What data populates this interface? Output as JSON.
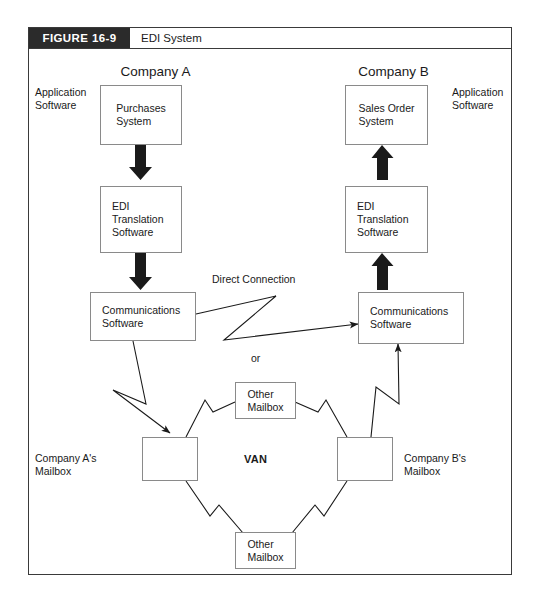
{
  "figure": {
    "tag": "FIGURE 16-9",
    "caption": "EDI System"
  },
  "colors": {
    "tag_background": "#2b2b2b",
    "tag_text": "#ffffff",
    "frame_border": "#3a3a3a",
    "box_border": "#8a8a8a",
    "line": "#1a1a1a",
    "page_background": "#ffffff"
  },
  "diagram": {
    "company_a_title": "Company A",
    "company_b_title": "Company B",
    "app_software_left": "Application\nSoftware",
    "app_software_right": "Application\nSoftware",
    "direct_connection": "Direct Connection",
    "or": "or",
    "van": "VAN",
    "mailbox_a_label": "Company A's\nMailbox",
    "mailbox_b_label": "Company B's\nMailbox",
    "nodes": [
      {
        "id": "purchases-system",
        "label": "Purchases\nSystem"
      },
      {
        "id": "edi-translation-a",
        "label": "EDI\nTranslation\nSoftware"
      },
      {
        "id": "communications-a",
        "label": "Communications\nSoftware"
      },
      {
        "id": "sales-order-system",
        "label": "Sales Order\nSystem"
      },
      {
        "id": "edi-translation-b",
        "label": "EDI\nTranslation\nSoftware"
      },
      {
        "id": "communications-b",
        "label": "Communications\nSoftware"
      },
      {
        "id": "other-mailbox-top",
        "label": "Other\nMailbox"
      },
      {
        "id": "other-mailbox-bottom",
        "label": "Other\nMailbox"
      },
      {
        "id": "mailbox-a",
        "label": ""
      },
      {
        "id": "mailbox-b",
        "label": ""
      }
    ]
  }
}
